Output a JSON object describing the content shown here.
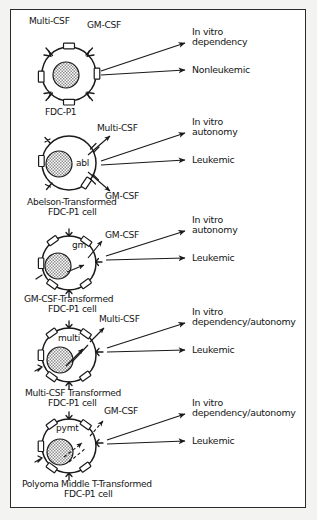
{
  "figure": {
    "colors": {
      "ink": "#1a1a1a",
      "paper": "#ffffff",
      "margin": "#f3f3f1",
      "nucleus_fill": "#a8a8a8"
    }
  },
  "panels": [
    {
      "id": "panel-fdcp1",
      "oncogene": "",
      "factor_labels": [
        {
          "name": "multi-csf-label",
          "text": "Multi-CSF"
        },
        {
          "name": "gm-csf-label",
          "text": "GM-CSF"
        }
      ],
      "cell_caption": [
        "FDC-P1"
      ],
      "outcomes": [
        {
          "name": "outcome-in-vitro",
          "lines": [
            "In vitro",
            "dependency"
          ]
        },
        {
          "name": "outcome-leukemia",
          "lines": [
            "Nonleukemic"
          ]
        }
      ]
    },
    {
      "id": "panel-abelson",
      "oncogene": "abl",
      "factor_labels": [
        {
          "name": "multi-csf-label",
          "text": "Multi-CSF"
        },
        {
          "name": "gm-csf-label",
          "text": "GM-CSF"
        }
      ],
      "cell_caption": [
        "Abelson-Transformed",
        "FDC-P1 cell"
      ],
      "outcomes": [
        {
          "name": "outcome-in-vitro",
          "lines": [
            "In vitro",
            "autonomy"
          ]
        },
        {
          "name": "outcome-leukemia",
          "lines": [
            "Leukemic"
          ]
        }
      ]
    },
    {
      "id": "panel-gmcsf",
      "oncogene": "gm",
      "factor_labels": [
        {
          "name": "gm-csf-label",
          "text": "GM-CSF"
        }
      ],
      "cell_caption": [
        "GM-CSF-Transformed",
        "FDC-P1 cell"
      ],
      "outcomes": [
        {
          "name": "outcome-in-vitro",
          "lines": [
            "In vitro",
            "autonomy"
          ]
        },
        {
          "name": "outcome-leukemia",
          "lines": [
            "Leukemic"
          ]
        }
      ]
    },
    {
      "id": "panel-multicsf",
      "oncogene": "multi",
      "factor_labels": [
        {
          "name": "multi-csf-label",
          "text": "Multi-CSF"
        }
      ],
      "cell_caption": [
        "Multi-CSF Transformed",
        "FDC-P1 cell"
      ],
      "outcomes": [
        {
          "name": "outcome-in-vitro",
          "lines": [
            "In vitro",
            "dependency/autonomy"
          ]
        },
        {
          "name": "outcome-leukemia",
          "lines": [
            "Leukemic"
          ]
        }
      ]
    },
    {
      "id": "panel-polyoma",
      "oncogene": "pymt",
      "factor_labels": [
        {
          "name": "gm-csf-label",
          "text": "GM-CSF"
        }
      ],
      "cell_caption": [
        "Polyoma Middle T-Transformed",
        "FDC-P1 cell"
      ],
      "outcomes": [
        {
          "name": "outcome-in-vitro",
          "lines": [
            "In vitro",
            "dependency/autonomy"
          ]
        },
        {
          "name": "outcome-leukemia",
          "lines": [
            "Leukemic"
          ]
        }
      ]
    }
  ]
}
